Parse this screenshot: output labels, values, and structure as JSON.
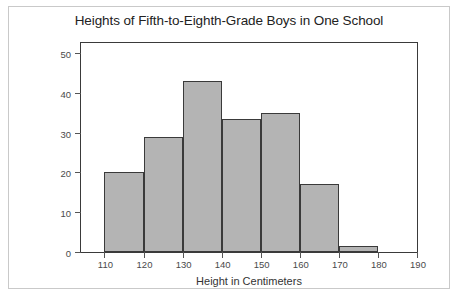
{
  "chart_data": {
    "type": "bar",
    "title": "Heights of Fifth-to-Eighth-Grade Boys in One School",
    "xlabel": "Height in Centimeters",
    "ylabel": "Number of Boys",
    "bin_width": 10,
    "bin_edges": [
      110,
      120,
      130,
      140,
      150,
      160,
      170,
      180
    ],
    "categories": [
      "110-120",
      "120-130",
      "130-140",
      "140-150",
      "150-160",
      "160-170",
      "170-180"
    ],
    "values": [
      20,
      29,
      43,
      33.5,
      35,
      17,
      1.5
    ],
    "xlim": [
      104,
      190
    ],
    "ylim": [
      0,
      52.5
    ],
    "xticks": [
      110,
      120,
      130,
      140,
      150,
      160,
      170,
      180,
      190
    ],
    "yticks": [
      0,
      10,
      20,
      30,
      40,
      50
    ],
    "xtick_labels": [
      "110",
      "120",
      "130",
      "140",
      "150",
      "160",
      "170",
      "180",
      "190"
    ],
    "ytick_labels": [
      "0",
      "10",
      "20",
      "30",
      "40",
      "50"
    ],
    "grid": false,
    "legend": null,
    "bar_fill_color": "#b4b4b4",
    "bar_edge_color": "#3a3a3a",
    "frame_color": "#3a3a3a",
    "background_color": "#ffffff",
    "text_color": "#333333"
  }
}
